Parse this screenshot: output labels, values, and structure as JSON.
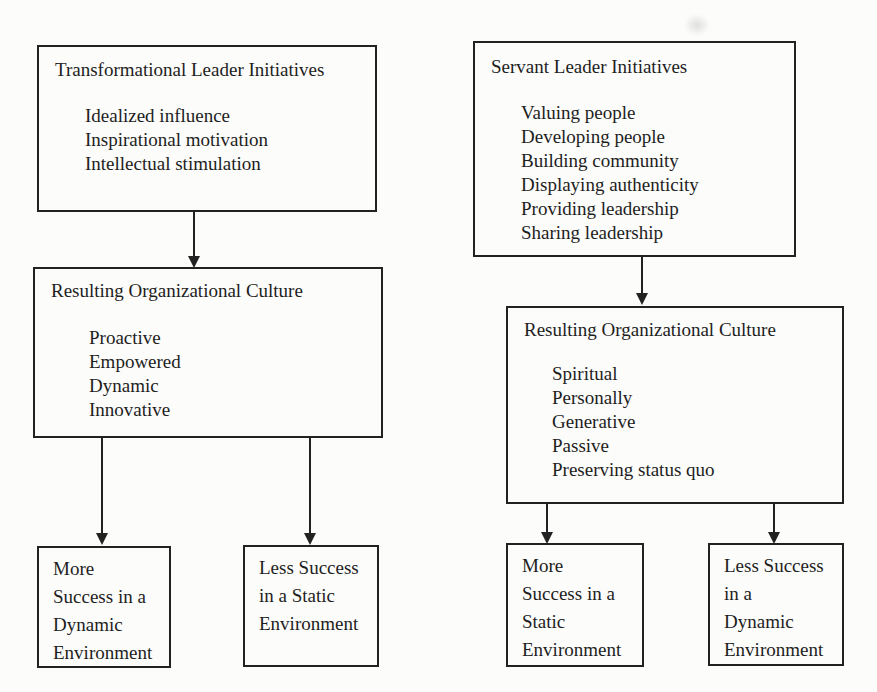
{
  "colors": {
    "ink": "#222222",
    "paper": "#fcfcfa",
    "text": "#1e1e1e"
  },
  "left": {
    "initiatives": {
      "title": "Transformational Leader Initiatives",
      "items": [
        "Idealized influence",
        "Inspirational motivation",
        "Intellectual stimulation"
      ]
    },
    "culture": {
      "title": "Resulting Organizational Culture",
      "items": [
        "Proactive",
        "Empowered",
        "Dynamic",
        "Innovative"
      ]
    },
    "outcome_more": {
      "lines": [
        "More",
        "Success in a",
        "Dynamic",
        "Environment"
      ]
    },
    "outcome_less": {
      "lines": [
        "Less Success",
        "in a Static",
        "Environment"
      ]
    }
  },
  "right": {
    "initiatives": {
      "title": "Servant Leader Initiatives",
      "items": [
        "Valuing people",
        "Developing people",
        "Building community",
        "Displaying authenticity",
        "Providing leadership",
        "Sharing leadership"
      ]
    },
    "culture": {
      "title": "Resulting Organizational Culture",
      "items": [
        "Spiritual",
        "Personally",
        "Generative",
        "Passive",
        "Preserving status quo"
      ]
    },
    "outcome_more": {
      "lines": [
        "More",
        "Success in a",
        "Static",
        "Environment"
      ]
    },
    "outcome_less": {
      "lines": [
        "Less Success",
        "in a",
        "Dynamic",
        "Environment"
      ]
    }
  }
}
